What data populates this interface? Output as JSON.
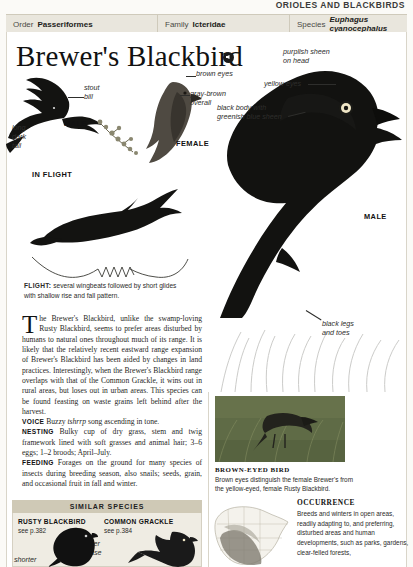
{
  "running_head": "ORIOLES AND BLACKBIRDS",
  "taxonomy": {
    "order_label": "Order",
    "order_value": "Passeriformes",
    "family_label": "Family",
    "family_value": "Icteridae",
    "species_label": "Species",
    "species_value": "Euphagus cyanocephalus"
  },
  "title": "Brewer's Blackbird",
  "annotations": {
    "stout_bill": "stout\nbill",
    "long_dark_tail": "long\ndark\ntail",
    "brown_eyes": "brown eyes",
    "gray_brown_overall": "gray-brown\noverall",
    "purplish_sheen": "purplish sheen\non head",
    "yellow_eyes": "yellow eyes",
    "black_body": "black body with\ngreenish blue sheen",
    "black_legs": "black legs\nand toes"
  },
  "plate_captions": {
    "male_flight": "MALE",
    "in_flight": "IN FLIGHT",
    "female": "FEMALE",
    "male_main": "MALE"
  },
  "flight": {
    "label": "FLIGHT:",
    "text": " several wingbeats followed by short glides with shallow rise and fall pattern."
  },
  "body": {
    "dropcap": "T",
    "paragraph": "he Brewer's Blackbird, unlike the swamp-loving Rusty Blackbird, seems to prefer areas disturbed by humans to natural ones throughout much of its range. It is likely that the relatively recent eastward range expansion of Brewer's Blackbird has been aided by changes in land practices. Interestingly, when the Brewer's Blackbird range overlaps with that of the Common Grackle, it wins out in rural areas, but loses out in urban areas. This species can be found feasting on waste grains left behind after the harvest.",
    "voice_label": "VOICE",
    "voice_pre": " Buzzy ",
    "voice_italic": "tshrrp",
    "voice_post": " song ascending in tone.",
    "nesting_label": "NESTING",
    "nesting_text": " Bulky cup of dry grass, stem and twig framework lined with soft grasses and animal hair; 3–6 eggs; 1–2 broods; April–July.",
    "feeding_label": "FEEDING",
    "feeding_text": " Forages on the ground for many species of insects during breeding season, also snails; seeds, grain, and occasional fruit in fall and winter."
  },
  "photo_caption": {
    "title": "BROWN-EYED BIRD",
    "text": "Brown eyes distinguish the female Brewer's from the yellow-eyed, female Rusty Blackbird."
  },
  "occurrence": {
    "title": "OCCURRENCE",
    "text": "Breeds and winters in open areas, readily adapting to, and preferring, disturbed areas and human developments, such as parks, gardens, clear-felled forests,"
  },
  "similar_species": {
    "header": "SIMILAR SPECIES",
    "items": [
      {
        "name": "RUSTY BLACKBIRD",
        "page": "see p.382"
      },
      {
        "name": "COMMON GRACKLE",
        "page": "see p.384"
      }
    ],
    "annotations": {
      "bill_thinner": "bill\nthinner\nat base",
      "shorter": "shorter",
      "longer": "longer"
    }
  },
  "colors": {
    "bird_black": "#111111",
    "bar_bg": "#e9e6dd",
    "simbox_head": "#cfc9b6",
    "eye_yellow": "#f2ead0"
  }
}
